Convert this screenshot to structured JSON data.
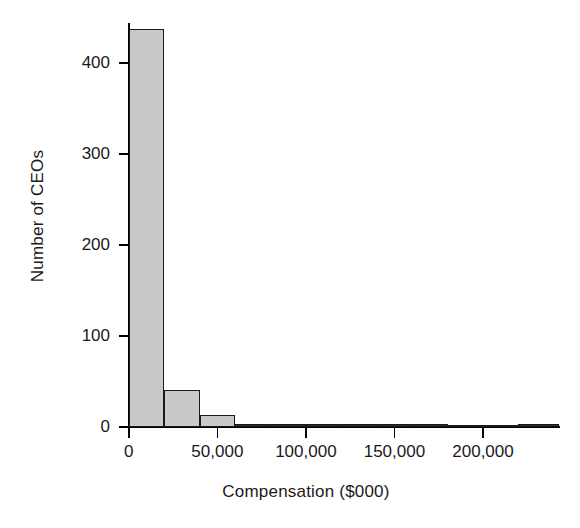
{
  "chart_data": {
    "type": "bar",
    "title": "",
    "subtitle": "",
    "xlabel": "Compensation ($000)",
    "ylabel": "Number of CEOs",
    "xlim": [
      0,
      243000
    ],
    "ylim": [
      0,
      460
    ],
    "grid": false,
    "legend": null,
    "bin_width": 20000,
    "xticks": [
      0,
      50000,
      100000,
      150000,
      200000
    ],
    "xtick_labels": [
      "0",
      "50,000",
      "100,000",
      "150,000",
      "200,000"
    ],
    "yticks": [
      0,
      100,
      200,
      300,
      400
    ],
    "ytick_labels": [
      "0",
      "100",
      "200",
      "300",
      "400"
    ],
    "bins": [
      {
        "start": 0,
        "end": 20000,
        "value": 437
      },
      {
        "start": 20000,
        "end": 40000,
        "value": 41
      },
      {
        "start": 40000,
        "end": 60000,
        "value": 13
      },
      {
        "start": 60000,
        "end": 80000,
        "value": 2
      },
      {
        "start": 80000,
        "end": 100000,
        "value": 3
      },
      {
        "start": 100000,
        "end": 120000,
        "value": 1
      },
      {
        "start": 120000,
        "end": 140000,
        "value": 2
      },
      {
        "start": 140000,
        "end": 160000,
        "value": 2
      },
      {
        "start": 160000,
        "end": 180000,
        "value": 1
      },
      {
        "start": 180000,
        "end": 200000,
        "value": 0
      },
      {
        "start": 200000,
        "end": 220000,
        "value": 0
      },
      {
        "start": 220000,
        "end": 243000,
        "value": 2
      }
    ],
    "bar_fill_color": "#c9c9c9",
    "bar_edge_color": "#1a1a1a",
    "background_color": "#ffffff"
  }
}
